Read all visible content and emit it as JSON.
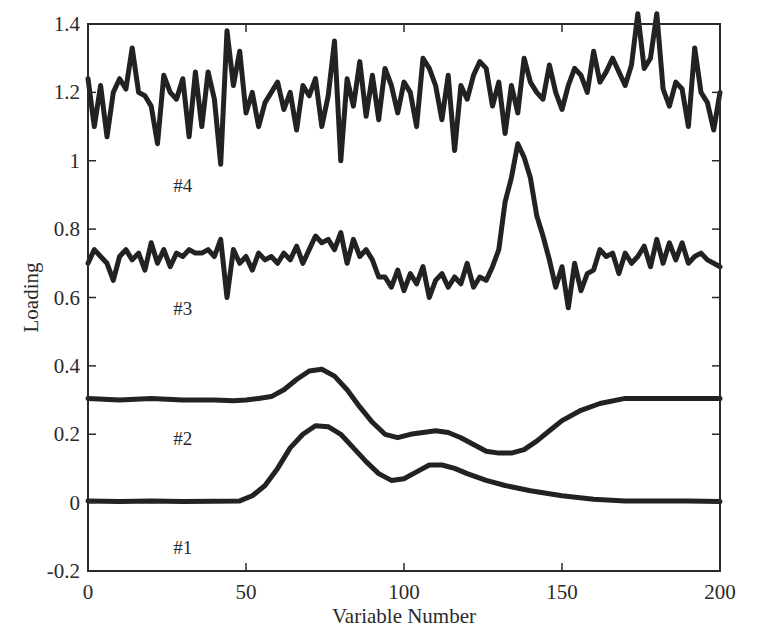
{
  "chart_data": {
    "type": "line",
    "title": "",
    "xlabel": "Variable Number",
    "ylabel": "Loading",
    "xlim": [
      0,
      200
    ],
    "ylim": [
      -0.2,
      1.4
    ],
    "xticks": [
      0,
      50,
      100,
      150,
      200
    ],
    "xtick_labels": [
      "0",
      "50",
      "100",
      "150",
      "200"
    ],
    "yticks": [
      -0.2,
      0,
      0.2,
      0.4,
      0.6,
      0.8,
      1,
      1.2,
      1.4
    ],
    "ytick_labels": [
      "-0.2",
      "0",
      "0.2",
      "0.4",
      "0.6",
      "0.8",
      "1",
      "1.2",
      "1.4"
    ],
    "grid": false,
    "legend": "none (curves labeled inline)",
    "line_color": "#222222",
    "annotations": [
      {
        "text": "#4",
        "x": 30,
        "y": 0.93
      },
      {
        "text": "#3",
        "x": 30,
        "y": 0.57
      },
      {
        "text": "#2",
        "x": 30,
        "y": 0.19
      },
      {
        "text": "#1",
        "x": 30,
        "y": -0.13
      }
    ],
    "series": [
      {
        "name": "#1",
        "x": [
          0,
          10,
          20,
          30,
          40,
          48,
          52,
          56,
          60,
          64,
          68,
          72,
          76,
          80,
          84,
          88,
          92,
          96,
          100,
          104,
          108,
          112,
          116,
          120,
          126,
          132,
          140,
          150,
          160,
          170,
          180,
          190,
          200
        ],
        "values": [
          0.005,
          0.003,
          0.005,
          0.003,
          0.004,
          0.005,
          0.02,
          0.05,
          0.1,
          0.16,
          0.2,
          0.225,
          0.222,
          0.2,
          0.16,
          0.12,
          0.085,
          0.065,
          0.07,
          0.09,
          0.11,
          0.11,
          0.1,
          0.085,
          0.065,
          0.05,
          0.035,
          0.02,
          0.01,
          0.005,
          0.005,
          0.005,
          0.003
        ]
      },
      {
        "name": "#2",
        "x": [
          0,
          10,
          20,
          30,
          40,
          46,
          50,
          54,
          58,
          62,
          66,
          70,
          74,
          78,
          82,
          86,
          90,
          94,
          98,
          102,
          106,
          110,
          114,
          118,
          122,
          126,
          130,
          134,
          138,
          142,
          146,
          150,
          156,
          162,
          170,
          180,
          190,
          200
        ],
        "values": [
          0.305,
          0.3,
          0.305,
          0.3,
          0.3,
          0.298,
          0.3,
          0.305,
          0.31,
          0.33,
          0.36,
          0.385,
          0.39,
          0.37,
          0.33,
          0.28,
          0.235,
          0.2,
          0.19,
          0.2,
          0.205,
          0.21,
          0.205,
          0.19,
          0.17,
          0.15,
          0.145,
          0.145,
          0.155,
          0.18,
          0.21,
          0.24,
          0.27,
          0.29,
          0.305,
          0.305,
          0.305,
          0.305
        ]
      },
      {
        "name": "#3",
        "x": [
          0,
          2,
          4,
          6,
          8,
          10,
          12,
          14,
          16,
          18,
          20,
          22,
          24,
          26,
          28,
          30,
          32,
          34,
          36,
          38,
          40,
          42,
          44,
          46,
          48,
          50,
          52,
          54,
          56,
          58,
          60,
          62,
          64,
          66,
          68,
          70,
          72,
          74,
          76,
          78,
          80,
          82,
          84,
          86,
          88,
          90,
          92,
          94,
          96,
          98,
          100,
          102,
          104,
          106,
          108,
          110,
          112,
          114,
          116,
          118,
          120,
          122,
          124,
          126,
          128,
          130,
          132,
          134,
          136,
          138,
          140,
          142,
          144,
          146,
          148,
          150,
          152,
          154,
          156,
          158,
          160,
          162,
          164,
          166,
          168,
          170,
          172,
          174,
          176,
          178,
          180,
          182,
          184,
          186,
          188,
          190,
          192,
          194,
          196,
          198,
          200
        ],
        "values": [
          0.7,
          0.74,
          0.72,
          0.7,
          0.65,
          0.72,
          0.74,
          0.71,
          0.73,
          0.68,
          0.76,
          0.7,
          0.74,
          0.69,
          0.73,
          0.72,
          0.74,
          0.73,
          0.73,
          0.74,
          0.72,
          0.77,
          0.6,
          0.74,
          0.7,
          0.72,
          0.68,
          0.73,
          0.71,
          0.72,
          0.7,
          0.73,
          0.71,
          0.75,
          0.7,
          0.74,
          0.78,
          0.76,
          0.77,
          0.74,
          0.79,
          0.7,
          0.77,
          0.72,
          0.74,
          0.71,
          0.66,
          0.66,
          0.63,
          0.68,
          0.62,
          0.67,
          0.64,
          0.69,
          0.6,
          0.65,
          0.67,
          0.63,
          0.66,
          0.64,
          0.7,
          0.63,
          0.66,
          0.65,
          0.69,
          0.74,
          0.88,
          0.95,
          1.05,
          1.01,
          0.95,
          0.84,
          0.78,
          0.71,
          0.63,
          0.69,
          0.57,
          0.7,
          0.62,
          0.67,
          0.68,
          0.74,
          0.72,
          0.73,
          0.67,
          0.73,
          0.7,
          0.72,
          0.75,
          0.69,
          0.77,
          0.7,
          0.76,
          0.71,
          0.76,
          0.7,
          0.72,
          0.73,
          0.71,
          0.7,
          0.69
        ]
      },
      {
        "name": "#4",
        "x": [
          0,
          2,
          4,
          6,
          8,
          10,
          12,
          14,
          16,
          18,
          20,
          22,
          24,
          26,
          28,
          30,
          32,
          34,
          36,
          38,
          40,
          42,
          44,
          46,
          48,
          50,
          52,
          54,
          56,
          58,
          60,
          62,
          64,
          66,
          68,
          70,
          72,
          74,
          76,
          78,
          80,
          82,
          84,
          86,
          88,
          90,
          92,
          94,
          96,
          98,
          100,
          102,
          104,
          106,
          108,
          110,
          112,
          114,
          116,
          118,
          120,
          122,
          124,
          126,
          128,
          130,
          132,
          134,
          136,
          138,
          140,
          142,
          144,
          146,
          148,
          150,
          152,
          154,
          156,
          158,
          160,
          162,
          164,
          166,
          168,
          170,
          172,
          174,
          176,
          178,
          180,
          182,
          184,
          186,
          188,
          190,
          192,
          194,
          196,
          198,
          200
        ],
        "values": [
          1.24,
          1.1,
          1.22,
          1.07,
          1.2,
          1.24,
          1.21,
          1.33,
          1.2,
          1.19,
          1.16,
          1.05,
          1.25,
          1.2,
          1.18,
          1.24,
          1.07,
          1.26,
          1.1,
          1.26,
          1.18,
          0.99,
          1.38,
          1.22,
          1.32,
          1.14,
          1.2,
          1.1,
          1.17,
          1.2,
          1.23,
          1.15,
          1.2,
          1.09,
          1.22,
          1.19,
          1.24,
          1.1,
          1.19,
          1.35,
          1.0,
          1.24,
          1.16,
          1.29,
          1.13,
          1.25,
          1.12,
          1.27,
          1.22,
          1.14,
          1.23,
          1.2,
          1.1,
          1.3,
          1.27,
          1.22,
          1.12,
          1.25,
          1.03,
          1.22,
          1.18,
          1.25,
          1.29,
          1.27,
          1.16,
          1.23,
          1.08,
          1.22,
          1.14,
          1.3,
          1.23,
          1.2,
          1.18,
          1.28,
          1.2,
          1.15,
          1.22,
          1.27,
          1.25,
          1.2,
          1.32,
          1.23,
          1.26,
          1.3,
          1.26,
          1.22,
          1.28,
          1.43,
          1.27,
          1.3,
          1.43,
          1.21,
          1.16,
          1.23,
          1.21,
          1.1,
          1.33,
          1.2,
          1.17,
          1.09,
          1.2
        ]
      }
    ]
  }
}
